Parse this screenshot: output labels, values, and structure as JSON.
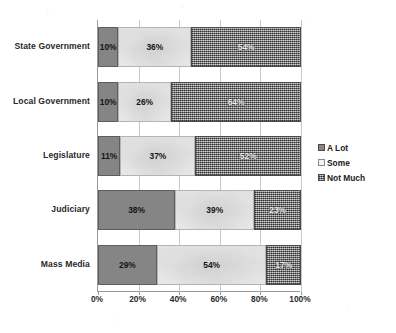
{
  "chart_data": {
    "type": "bar",
    "subtype": "stacked-horizontal-100pct",
    "title": "",
    "subtitle": "",
    "xlabel": "",
    "ylabel": "",
    "xlim": [
      0,
      100
    ],
    "xticks": [
      "0%",
      "20%",
      "40%",
      "60%",
      "80%",
      "100%"
    ],
    "xtick_values": [
      0,
      20,
      40,
      60,
      80,
      100
    ],
    "grid": true,
    "grid_axis": "x",
    "legend_position": "right",
    "categories": [
      "State Government",
      "Local Government",
      "Legislature",
      "Judiciary",
      "Mass Media"
    ],
    "series": [
      {
        "name": "A Lot",
        "color": "#858585",
        "fill": "solid-gray",
        "values": [
          10,
          10,
          11,
          38,
          29
        ],
        "labels": [
          "10%",
          "10%",
          "11%",
          "38%",
          "29%"
        ]
      },
      {
        "name": "Some",
        "color": "#e9e9e9",
        "fill": "light-gray",
        "values": [
          36,
          26,
          37,
          39,
          54
        ],
        "labels": [
          "36%",
          "26%",
          "37%",
          "39%",
          "54%"
        ]
      },
      {
        "name": "Not Much",
        "color": "#a0a0a0",
        "fill": "dither-texture",
        "values": [
          54,
          64,
          52,
          23,
          17
        ],
        "labels": [
          "54%",
          "64%",
          "52%",
          "23%",
          "17%"
        ]
      }
    ]
  },
  "legend": {
    "items": [
      {
        "label": "A Lot",
        "swatch": "alot"
      },
      {
        "label": "Some",
        "swatch": "some"
      },
      {
        "label": "Not Much",
        "swatch": "notmuch"
      }
    ]
  }
}
